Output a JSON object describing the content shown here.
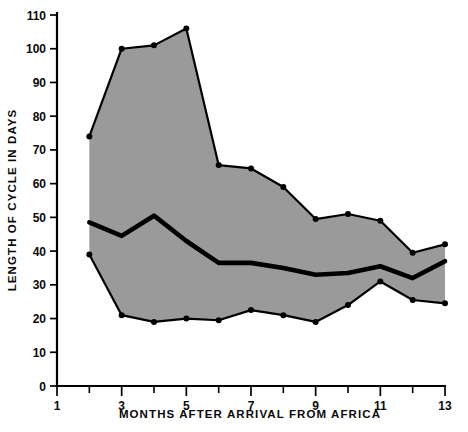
{
  "chart_data": {
    "type": "line",
    "title": "",
    "xlabel": "MONTHS AFTER ARRIVAL FROM AFRICA",
    "ylabel": "LENGTH OF CYCLE IN DAYS",
    "xlim": [
      1,
      13
    ],
    "ylim": [
      0,
      110
    ],
    "grid": false,
    "legend": "none",
    "x": [
      2,
      3,
      4,
      5,
      6,
      7,
      8,
      9,
      10,
      11,
      12,
      13
    ],
    "x_ticks_major": [
      1,
      3,
      5,
      7,
      9,
      11,
      13
    ],
    "x_ticks_minor": [
      2,
      4,
      6,
      8,
      10,
      12
    ],
    "x_tick_labels": [
      "1",
      "3",
      "5",
      "7",
      "9",
      "11",
      "13"
    ],
    "y_ticks": [
      0,
      10,
      20,
      30,
      40,
      50,
      60,
      70,
      80,
      90,
      100,
      110
    ],
    "y_tick_labels": [
      "0",
      "10",
      "20",
      "30",
      "40",
      "50",
      "60",
      "70",
      "80",
      "90",
      "100",
      "110"
    ],
    "series": [
      {
        "name": "Maximum",
        "role": "upper-bound",
        "values": [
          74,
          100,
          101,
          106,
          65.5,
          64.5,
          59,
          49.5,
          51,
          49,
          39.5,
          42
        ]
      },
      {
        "name": "Mean",
        "role": "median",
        "values": [
          48.5,
          44.5,
          50.5,
          43,
          36.5,
          36.5,
          35,
          33,
          33.5,
          35.5,
          32,
          37
        ]
      },
      {
        "name": "Minimum",
        "role": "lower-bound",
        "values": [
          39,
          21,
          19,
          20,
          19.5,
          22.5,
          21,
          19,
          24,
          31,
          25.5,
          24.5
        ]
      }
    ],
    "band_fill": "#9a9a9a",
    "line_color": "#000000"
  }
}
